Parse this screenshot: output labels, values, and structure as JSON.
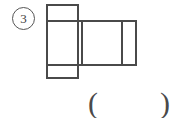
{
  "page": {
    "width": 178,
    "height": 118,
    "background_color": "#ffffff"
  },
  "question": {
    "number_label": "3",
    "number_marker_style": "circled"
  },
  "figure": {
    "name": "box-net-diagram",
    "stroke_color": "#4a4a4a",
    "fill_color": "#ffffff",
    "stroke_width": 1.6,
    "faces": [
      {
        "name": "top-flap",
        "x": 47,
        "y": 5,
        "width": 31,
        "height": 16
      },
      {
        "name": "front-face",
        "x": 47,
        "y": 21,
        "width": 31,
        "height": 44
      },
      {
        "name": "bottom-flap",
        "x": 47,
        "y": 65,
        "width": 31,
        "height": 13
      },
      {
        "name": "side-face-1",
        "x": 78,
        "y": 21,
        "width": 4,
        "height": 44
      },
      {
        "name": "back-face",
        "x": 82,
        "y": 21,
        "width": 40,
        "height": 44
      },
      {
        "name": "side-face-2",
        "x": 122,
        "y": 21,
        "width": 14,
        "height": 44
      }
    ]
  },
  "answer_field": {
    "open_paren": "(",
    "close_paren": ")"
  }
}
